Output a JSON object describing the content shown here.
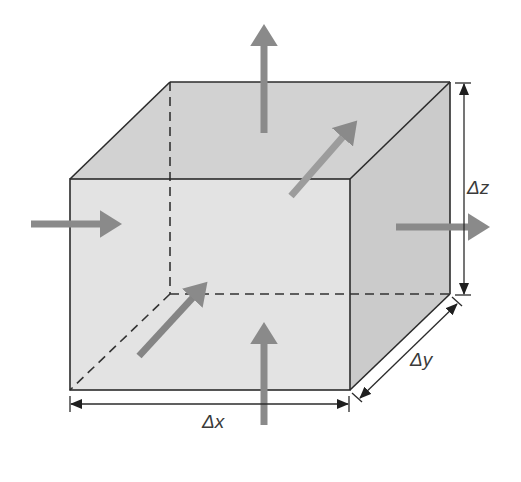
{
  "diagram": {
    "colors": {
      "background": "#ffffff",
      "front_face": "#e4e4e4",
      "top_face": "#d2d2d2",
      "side_face": "#cccccc",
      "edge": "#2b2b2b",
      "hidden_edge": "#333333",
      "flux_arrow": "#8a8a8a",
      "dimension_line": "#2b2b2b",
      "label": "#3a3a3a"
    },
    "cube": {
      "front_face": {
        "x1": 70,
        "y1": 179,
        "x2": 350,
        "y2": 390
      },
      "depth_offset": {
        "dx": 100,
        "dy": -97
      }
    },
    "dimensions": [
      {
        "id": "dx",
        "label": "Δx",
        "axis": "x"
      },
      {
        "id": "dy",
        "label": "Δy",
        "axis": "y"
      },
      {
        "id": "dz",
        "label": "Δz",
        "axis": "z"
      }
    ],
    "flux_arrows": [
      {
        "id": "top-out",
        "direction": "up",
        "description": "flux leaving through top face"
      },
      {
        "id": "bottom-in",
        "direction": "up",
        "description": "flux entering through bottom face"
      },
      {
        "id": "left-in",
        "direction": "right",
        "description": "flux entering through left face"
      },
      {
        "id": "right-out",
        "direction": "right",
        "description": "flux leaving through right face"
      },
      {
        "id": "front-in",
        "direction": "diagonal-back",
        "description": "flux entering through front face"
      },
      {
        "id": "back-out",
        "direction": "diagonal-back",
        "description": "flux leaving through back face"
      }
    ],
    "labels": {
      "dx": "Δx",
      "dy": "Δy",
      "dz": "Δz"
    }
  }
}
